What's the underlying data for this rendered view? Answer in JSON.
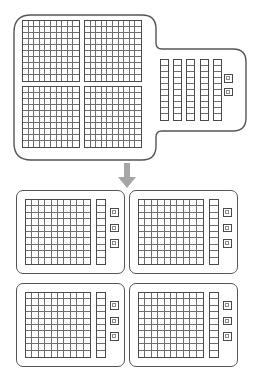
{
  "diagram": {
    "type": "place-value-blocks-division",
    "arrow_icon": "arrow-down-icon",
    "arrow_color": "#a6a6a6",
    "outline_color": "#555555",
    "grid_line_color": "#6e6e6e",
    "block_border_color": "#4a4a4a",
    "background_color": "#ffffff"
  },
  "total": {
    "label": "452",
    "hundreds": 4,
    "tens": 5,
    "ones": 2,
    "hundred_flat_rows": 10,
    "hundred_flat_cols": 10,
    "ten_rod_cells": 10
  },
  "groups": {
    "count": 4,
    "per_group_label": "113",
    "items": [
      {
        "label": "113",
        "hundreds": 1,
        "tens": 1,
        "ones": 3
      },
      {
        "label": "113",
        "hundreds": 1,
        "tens": 1,
        "ones": 3
      },
      {
        "label": "113",
        "hundreds": 1,
        "tens": 1,
        "ones": 3
      },
      {
        "label": "113",
        "hundreds": 1,
        "tens": 1,
        "ones": 3
      }
    ],
    "hundred_flat_rows": 10,
    "hundred_flat_cols": 10,
    "ten_rod_cells": 10
  },
  "chart_data": {
    "type": "table",
    "categories": [
      "hundreds",
      "tens",
      "ones"
    ],
    "series": [
      {
        "name": "total (452)",
        "values": [
          4,
          5,
          2
        ]
      },
      {
        "name": "group 1 (113)",
        "values": [
          1,
          1,
          3
        ]
      },
      {
        "name": "group 2 (113)",
        "values": [
          1,
          1,
          3
        ]
      },
      {
        "name": "group 3 (113)",
        "values": [
          1,
          1,
          3
        ]
      },
      {
        "name": "group 4 (113)",
        "values": [
          1,
          1,
          3
        ]
      }
    ]
  }
}
